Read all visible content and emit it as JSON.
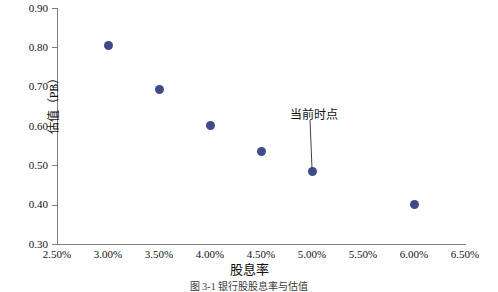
{
  "chart_data": {
    "type": "scatter",
    "title": "",
    "xlabel": "股息率",
    "ylabel": "估值（PB）",
    "xlim": [
      2.5,
      6.5
    ],
    "ylim": [
      0.3,
      0.9
    ],
    "grid": false,
    "legend": "none",
    "marker_color": "#3f4a8a",
    "axis_color": "#7d7d7d",
    "x_tick_labels": [
      "2.50%",
      "3.00%",
      "3.50%",
      "4.00%",
      "4.50%",
      "5.00%",
      "5.50%",
      "6.00%",
      "6.50%"
    ],
    "x_tick_values": [
      2.5,
      3.0,
      3.5,
      4.0,
      4.5,
      5.0,
      5.5,
      6.0,
      6.5
    ],
    "y_tick_labels": [
      "0.90",
      "0.80",
      "0.70",
      "0.60",
      "0.50",
      "0.40",
      "0.30"
    ],
    "y_tick_values": [
      0.9,
      0.8,
      0.7,
      0.6,
      0.5,
      0.4,
      0.3
    ],
    "x": [
      3.0,
      3.5,
      4.0,
      4.5,
      5.0,
      6.0
    ],
    "y": [
      0.805,
      0.692,
      0.601,
      0.536,
      0.484,
      0.401
    ],
    "points": [
      {
        "x": 3.0,
        "y": 0.805
      },
      {
        "x": 3.5,
        "y": 0.692
      },
      {
        "x": 4.0,
        "y": 0.601
      },
      {
        "x": 4.5,
        "y": 0.536
      },
      {
        "x": 5.0,
        "y": 0.484
      },
      {
        "x": 6.0,
        "y": 0.401
      }
    ],
    "annotations": [
      {
        "text": "当前时点",
        "label_x": 5.02,
        "label_y": 0.628,
        "target_x": 5.0,
        "target_y": 0.484
      }
    ]
  },
  "caption": {
    "text": "图 3-1  银行股股息率与估值"
  }
}
